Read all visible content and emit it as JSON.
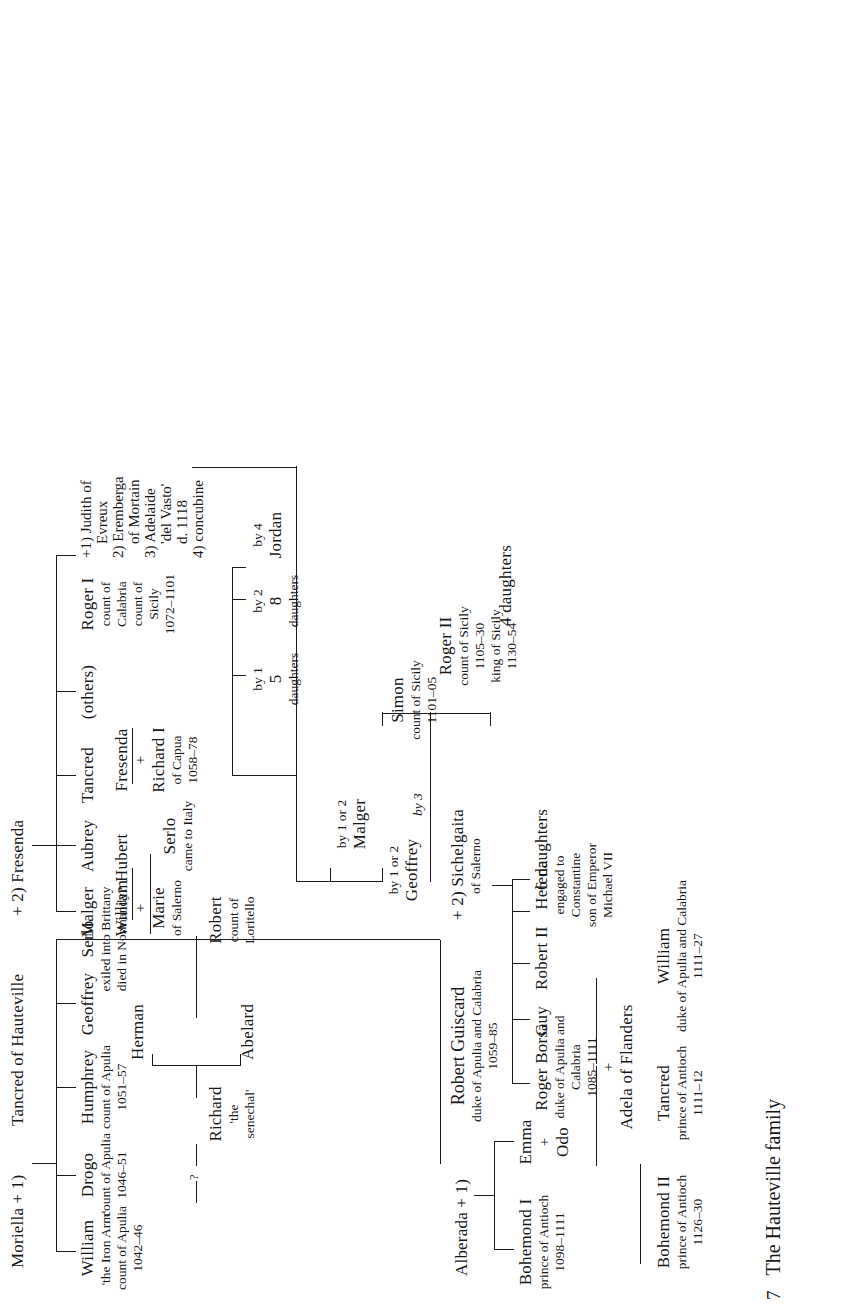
{
  "caption": {
    "number": "7",
    "text": "The Hauteville family"
  },
  "root": {
    "wife1": "Moriella + 1)",
    "father": "Tancred of Hauteville",
    "wife2": "+ 2) Fresenda"
  },
  "gen1_moriella": [
    {
      "name": "William",
      "lines": [
        "'the Iron Arm'",
        "count of Apulia",
        "1042–46"
      ]
    },
    {
      "name": "Drogo",
      "lines": [
        "count of Apulia",
        "1046–51"
      ]
    },
    {
      "name": "Humphrey",
      "lines": [
        "count of Apulia",
        "1051–57"
      ]
    },
    {
      "name": "Geoffrey",
      "lines": []
    },
    {
      "name": "Serlo",
      "lines": [
        "exiled into Brittany",
        "died in Normandy?"
      ]
    },
    {
      "name": "Robert Guiscard",
      "lines": [
        "duke of Apulia and Calabria",
        "1059–85"
      ]
    }
  ],
  "gen1_fresenda": [
    {
      "name": "Malger",
      "lines": []
    },
    {
      "name": "Aubrey",
      "lines": []
    },
    {
      "name": "Tancred",
      "lines": []
    },
    {
      "name": "(others)",
      "lines": []
    },
    {
      "name": "Roger I",
      "lines": [
        "count of",
        "Calabria",
        "count of",
        "Sicily",
        "1072–1101"
      ]
    }
  ],
  "drogo_child": {
    "link": "?",
    "name": "Richard",
    "lines": [
      "'the",
      "senechal'"
    ]
  },
  "humphrey_children": [
    {
      "name": "Abelard",
      "lines": []
    },
    {
      "name": "Herman",
      "lines": []
    }
  ],
  "geoffrey_child": {
    "name": "Robert",
    "lines": [
      "count of",
      "Loritello"
    ]
  },
  "serlo_child": {
    "name": "Serlo",
    "lines": [
      "came to Italy"
    ]
  },
  "malger_child": {
    "name": "William",
    "plus": "+",
    "spouse": "Marie",
    "spouse_lines": [
      "of Salerno"
    ]
  },
  "aubrey_child": {
    "name": "Hubert",
    "lines": []
  },
  "tancred_child": {
    "name": "Fresenda",
    "plus": "+",
    "spouse": "Richard I",
    "spouse_lines": [
      "of Capua",
      "1058–78"
    ]
  },
  "roger1_wives": [
    "+1) Judith of",
    "Evreux",
    "2) Eremberga",
    "of Mortain",
    "3) Adelaide",
    "'del Vasto'",
    "d. 1118",
    "4) concubine"
  ],
  "roger1_children": [
    {
      "by": "by 1 or 2",
      "name": "Geoffrey",
      "lines": []
    },
    {
      "by": "by 1 or 2",
      "name": "Malger",
      "lines": []
    },
    {
      "by": "by 1",
      "name": "5",
      "lines": [
        "daughters"
      ]
    },
    {
      "by": "by 2",
      "name": "8",
      "lines": [
        "daughters"
      ]
    },
    {
      "by": "by 4",
      "name": "Jordan",
      "lines": []
    }
  ],
  "by3_label": "by 3",
  "by3_children": [
    {
      "name": "Simon",
      "lines": [
        "count of Sicily",
        "1101–05"
      ]
    },
    {
      "name": "Roger II",
      "lines": [
        "count of Sicily",
        "1105–30",
        "king of Sicily",
        "1130–54"
      ]
    },
    {
      "name": "4 daughters",
      "lines": []
    }
  ],
  "guiscard": {
    "wife1": "Alberada + 1)",
    "name": "Robert Guiscard",
    "lines": [
      "duke of Apulia and Calabria",
      "1059–85"
    ],
    "wife2": "+ 2) Sichelgaita",
    "wife2_sub": "of Salerno"
  },
  "guiscard_alberada_children": [
    {
      "name": "Bohemond I",
      "lines": [
        "prince of Antioch",
        "1098–1111"
      ]
    },
    {
      "name": "Emma",
      "plus": "+",
      "spouse": "Odo",
      "lines": []
    }
  ],
  "guiscard_sichelgaita_children": [
    {
      "name": "Roger Borsa",
      "lines": [
        "duke of Apulia and",
        "Calabria",
        "1085–1111"
      ],
      "plus": "+",
      "spouse": "Adela of Flanders"
    },
    {
      "name": "Guy",
      "lines": []
    },
    {
      "name": "Robert II",
      "lines": []
    },
    {
      "name": "Helena",
      "lines": [
        "engaged to",
        "Constantine",
        "son of Emperor",
        "Michael VII"
      ]
    },
    {
      "name": "6 daughters",
      "lines": []
    }
  ],
  "gen3": [
    {
      "name": "Bohemond II",
      "lines": [
        "prince of Antioch",
        "1126–30"
      ]
    },
    {
      "name": "Tancred",
      "lines": [
        "prince of Antioch",
        "1111–12"
      ]
    },
    {
      "name": "William",
      "lines": [
        "duke of Apulia and Calabria",
        "1111–27"
      ]
    }
  ]
}
